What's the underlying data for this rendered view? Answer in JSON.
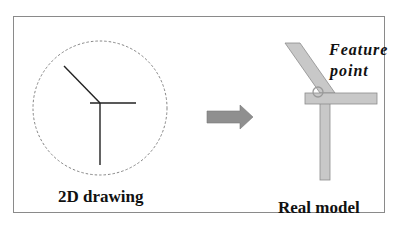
{
  "figure": {
    "left_panel": {
      "label": "2D drawing"
    },
    "right_panel": {
      "label": "Real model",
      "annotation_line1": "Feature",
      "annotation_line2": "point"
    },
    "colors": {
      "frame": "#8a8a8a",
      "ink": "#222222",
      "bar_fill": "#c8c8c8",
      "bar_stroke": "#8c8c8c",
      "arrow_fill": "#8f8f8f",
      "feature_circle": "#9a9a9a"
    }
  }
}
